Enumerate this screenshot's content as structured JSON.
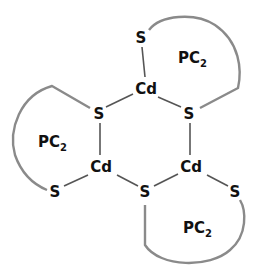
{
  "diagram": {
    "atoms": {
      "s_top": "S",
      "cd_top": "Cd",
      "s_ring_left": "S",
      "s_ring_right": "S",
      "cd_left": "Cd",
      "cd_right": "Cd",
      "s_bottom_left": "S",
      "s_bottom_mid": "S",
      "s_bottom_right": "S"
    },
    "ligands": [
      {
        "label": "PC",
        "subscript": "2",
        "position": "top-right"
      },
      {
        "label": "PC",
        "subscript": "2",
        "position": "left"
      },
      {
        "label": "PC",
        "subscript": "2",
        "position": "bottom-right"
      }
    ],
    "colors": {
      "text": "#111111",
      "bond": "#555555",
      "ligand_loop": "#8a8a8a"
    }
  }
}
